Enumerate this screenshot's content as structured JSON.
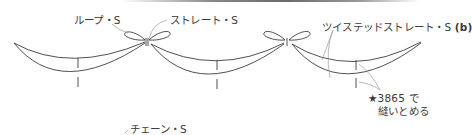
{
  "labels": {
    "loop_stitch": "ループ・S",
    "straight_stitch": "ストレート・S",
    "twisted_straight_stitch": "ツイステッドストレート・S",
    "twisted_suffix": "(b)",
    "tack_line1": "★3865 で",
    "tack_line2": "縫いとめる",
    "chain_stitch": "チェーン・S"
  },
  "colors": {
    "stroke": "#3c3c3c",
    "leader": "#9a9a9a",
    "text": "#3a3a3a"
  },
  "swags": [
    {
      "name": "left-swag",
      "start": [
        14,
        43
      ],
      "end": [
        145,
        43
      ],
      "upper_bottom_y": 64,
      "lower_bottom_y": 82,
      "tick_x": 78
    },
    {
      "name": "middle-swag",
      "start": [
        152,
        44
      ],
      "end": [
        284,
        44
      ],
      "upper_bottom_y": 65,
      "lower_bottom_y": 84,
      "tick_x": 217
    },
    {
      "name": "right-swag",
      "start": [
        292,
        44
      ],
      "end": [
        421,
        42
      ],
      "upper_bottom_y": 66,
      "lower_bottom_y": 84,
      "tick_x": 356
    }
  ],
  "bows": [
    {
      "name": "bow-1",
      "center": [
        147,
        42
      ]
    },
    {
      "name": "bow-2",
      "center": [
        287,
        42
      ]
    }
  ]
}
